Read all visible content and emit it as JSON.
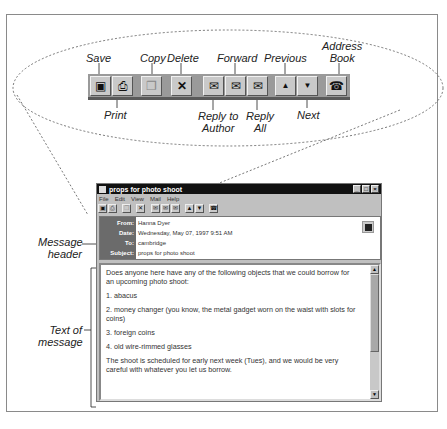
{
  "callouts": {
    "save": "Save",
    "print": "Print",
    "copy": "Copy",
    "delete": "Delete",
    "reply_to_author": [
      "Reply to",
      "Author"
    ],
    "forward": "Forward",
    "reply_all": [
      "Reply",
      "All"
    ],
    "previous": "Previous",
    "next": "Next",
    "address_book": [
      "Address",
      "Book"
    ],
    "message_header": [
      "Message",
      "header"
    ],
    "text_of_message": [
      "Text of",
      "message"
    ]
  },
  "toolbar": {
    "buttons": [
      {
        "name": "save",
        "icon": "floppy-disk-icon",
        "glyph": "▣"
      },
      {
        "name": "print",
        "icon": "printer-icon",
        "glyph": "⎙"
      },
      {
        "name": "copy",
        "icon": "copy-icon",
        "glyph": "❐"
      },
      {
        "name": "delete",
        "icon": "x-icon",
        "glyph": "✕"
      },
      {
        "name": "reply-to-author",
        "icon": "envelope-reply-icon",
        "glyph": "✉"
      },
      {
        "name": "forward",
        "icon": "envelope-forward-icon",
        "glyph": "✉"
      },
      {
        "name": "reply-all",
        "icon": "envelope-reply-all-icon",
        "glyph": "✉"
      },
      {
        "name": "previous",
        "icon": "arrow-up-icon",
        "glyph": "▲"
      },
      {
        "name": "next",
        "icon": "arrow-down-icon",
        "glyph": "▼"
      },
      {
        "name": "address-book",
        "icon": "address-book-icon",
        "glyph": "☎"
      }
    ]
  },
  "window": {
    "title": "props for photo shoot",
    "controls": {
      "minimize": "_",
      "maximize": "□",
      "close": "×"
    },
    "menu": [
      "File",
      "Edit",
      "View",
      "Mail",
      "Help"
    ]
  },
  "header": {
    "from_label": "From:",
    "from_value": "Hanna Dyer",
    "date_label": "Date:",
    "date_value": "Wednesday, May 07, 1997 9:51 AM",
    "to_label": "To:",
    "to_value": "cambridge",
    "subject_label": "Subject:",
    "subject_value": "props for photo shoot"
  },
  "message": {
    "intro": "Does anyone here have any of the following objects that we could borrow for an upcoming photo shoot:",
    "item1": "1. abacus",
    "item2": "2. money changer (you know, the metal gadget worn on the waist with slots for coins)",
    "item3": "3. foreign coins",
    "item4": "4. old wire-rimmed glasses",
    "closing": "The shoot is scheduled for early next week (Tues), and we would be very careful with whatever you let us borrow."
  },
  "colors": {
    "toolbar_bg": "#9a9a9a",
    "button_face": "#c9c9c9",
    "titlebar": "#111111",
    "header_label_bg": "#6b6b6b"
  }
}
